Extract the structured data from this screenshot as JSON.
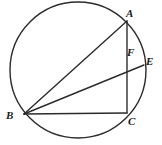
{
  "figure": {
    "type": "circle-geometry-diagram",
    "width": 162,
    "height": 145,
    "background_color": "#ffffff",
    "stroke_color": "#2b2b2b",
    "label_color": "#1a1a1a",
    "circle": {
      "center_x": 78,
      "center_y": 70,
      "radius": 68,
      "stroke_width": 1.4
    },
    "points": [
      {
        "id": "A",
        "label": "A",
        "x": 127,
        "y": 21,
        "on_circle": true,
        "label_x": 126,
        "label_y": 8
      },
      {
        "id": "B",
        "label": "B",
        "x": 24,
        "y": 114,
        "on_circle": true,
        "label_x": 6,
        "label_y": 110
      },
      {
        "id": "C",
        "label": "C",
        "x": 127,
        "y": 113,
        "on_circle": true,
        "label_x": 128,
        "label_y": 116
      },
      {
        "id": "E",
        "label": "E",
        "x": 144,
        "y": 65,
        "on_circle": true,
        "label_x": 146,
        "label_y": 56
      },
      {
        "id": "F",
        "label": "F",
        "x": 127,
        "y": 62,
        "on_circle": false,
        "label_x": 127,
        "label_y": 47
      }
    ],
    "segments": [
      {
        "id": "BA",
        "from": "B",
        "to": "A",
        "from_x": 24,
        "from_y": 114,
        "to_x": 127,
        "to_y": 21,
        "stroke_width": 1.4
      },
      {
        "id": "BE",
        "from": "B",
        "to": "E",
        "from_x": 24,
        "from_y": 114,
        "to_x": 144,
        "to_y": 65,
        "stroke_width": 1.4
      },
      {
        "id": "BC",
        "from": "B",
        "to": "C",
        "from_x": 24,
        "from_y": 114,
        "to_x": 127,
        "to_y": 113,
        "stroke_width": 1.4
      },
      {
        "id": "AC",
        "from": "A",
        "to": "C",
        "from_x": 127,
        "from_y": 21,
        "to_x": 127,
        "to_y": 113,
        "stroke_width": 1.4
      }
    ]
  }
}
